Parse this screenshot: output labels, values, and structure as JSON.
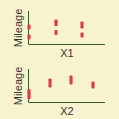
{
  "background": "#f7f3cf",
  "point_color": "#e03a45",
  "chart_data": [
    {
      "type": "scatter",
      "title": "",
      "xlabel": "X1",
      "ylabel": "Mileage",
      "xlim": [
        0,
        3
      ],
      "ylim": [
        0,
        10
      ],
      "grid": false,
      "points": [
        {
          "x": 0,
          "y": 5.6
        },
        {
          "x": 0,
          "y": 5.0
        },
        {
          "x": 0,
          "y": 2.5
        },
        {
          "x": 0,
          "y": 1.9
        },
        {
          "x": 1,
          "y": 7.2
        },
        {
          "x": 1,
          "y": 6.6
        },
        {
          "x": 1,
          "y": 6.0
        },
        {
          "x": 1,
          "y": 3.9
        },
        {
          "x": 1,
          "y": 3.3
        },
        {
          "x": 2,
          "y": 6.6
        },
        {
          "x": 2,
          "y": 6.0
        },
        {
          "x": 2,
          "y": 5.3
        },
        {
          "x": 2,
          "y": 3.1
        },
        {
          "x": 2,
          "y": 2.5
        }
      ]
    },
    {
      "type": "scatter",
      "title": "",
      "xlabel": "X2",
      "ylabel": "Mileage",
      "xlim": [
        0,
        4
      ],
      "ylim": [
        0,
        10
      ],
      "grid": false,
      "points": [
        {
          "x": 0,
          "y": 3.6
        },
        {
          "x": 0,
          "y": 3.1
        },
        {
          "x": 0,
          "y": 2.5
        },
        {
          "x": 0,
          "y": 1.9
        },
        {
          "x": 0,
          "y": 1.3
        },
        {
          "x": 1,
          "y": 6.9
        },
        {
          "x": 1,
          "y": 6.3
        },
        {
          "x": 1,
          "y": 5.6
        },
        {
          "x": 1,
          "y": 5.0
        },
        {
          "x": 2,
          "y": 7.8
        },
        {
          "x": 2,
          "y": 7.2
        },
        {
          "x": 2,
          "y": 6.6
        },
        {
          "x": 2,
          "y": 5.9
        },
        {
          "x": 3,
          "y": 5.9
        },
        {
          "x": 3,
          "y": 5.3
        },
        {
          "x": 3,
          "y": 4.7
        }
      ]
    }
  ]
}
